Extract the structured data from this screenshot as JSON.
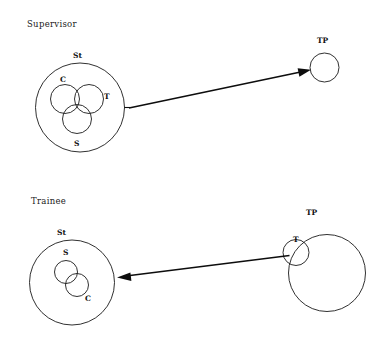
{
  "figure": {
    "type": "diagram",
    "background_color": "#ffffff",
    "stroke_color": "#1a1a1a",
    "panels": [
      {
        "id": "supervisor",
        "title": "Supervisor",
        "left_group": {
          "outer_label": "St",
          "inner_labels": [
            "C",
            "T",
            "S"
          ],
          "inner_count": 3,
          "relation": "three mutually overlapping circles"
        },
        "right_group": {
          "label": "TP",
          "inner_labels": [],
          "inner_count": 0
        },
        "arrow_direction": "left-to-right"
      },
      {
        "id": "trainee",
        "title": "Trainee",
        "left_group": {
          "outer_label": "St",
          "inner_labels": [
            "S",
            "C"
          ],
          "inner_count": 2,
          "relation": "two overlapping circles"
        },
        "right_group": {
          "label": "TP",
          "inner_labels": [
            "T"
          ],
          "inner_count": 1
        },
        "arrow_direction": "right-to-left"
      }
    ]
  },
  "labels": {
    "supervisor_title": "Supervisor",
    "supervisor_st": "St",
    "supervisor_c": "C",
    "supervisor_t": "T",
    "supervisor_s": "S",
    "supervisor_tp": "TP",
    "trainee_title": "Trainee",
    "trainee_st": "St",
    "trainee_s": "S",
    "trainee_c": "C",
    "trainee_tp": "TP",
    "trainee_t": "T"
  }
}
